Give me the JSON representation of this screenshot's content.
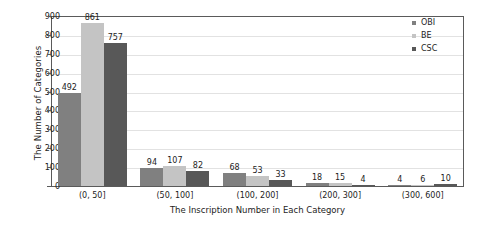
{
  "chart_data": {
    "type": "bar",
    "title": "",
    "xlabel": "The Inscription Number in Each Category",
    "ylabel": "The Number of Categories",
    "categories": [
      "(0, 50]",
      "(50, 100]",
      "(100, 200]",
      "(200, 300]",
      "(300, 600]"
    ],
    "series": [
      {
        "name": "OBI",
        "color": "#808080",
        "values": [
          492,
          94,
          68,
          18,
          4
        ]
      },
      {
        "name": "BE",
        "color": "#c4c4c4",
        "values": [
          861,
          107,
          53,
          15,
          6
        ]
      },
      {
        "name": "CSC",
        "color": "#585858",
        "values": [
          757,
          82,
          33,
          4,
          10
        ]
      }
    ],
    "ylim": [
      0,
      900
    ],
    "yticks": [
      0,
      100,
      200,
      300,
      400,
      500,
      600,
      700,
      800,
      900
    ],
    "grid": true,
    "legend_position": "top-right"
  }
}
